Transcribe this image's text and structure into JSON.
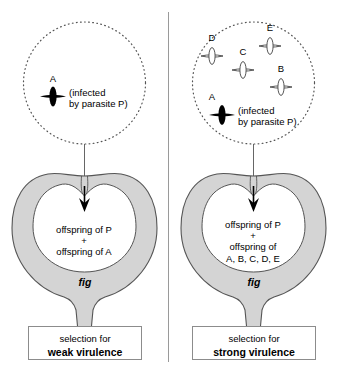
{
  "figure": {
    "colors": {
      "fig_flesh": "#d4d4d4",
      "fig_outline": "#555555",
      "circle_dotted": "#555555",
      "divider": "#9a9a9a",
      "caption_border": "#8c8c8c",
      "black": "#000000",
      "white": "#ffffff"
    }
  },
  "panels": [
    {
      "id": "weak-virulence",
      "circle": {
        "wasps": [
          {
            "id": "A",
            "label": "A",
            "style": "filled-black",
            "orientation": "vertical"
          }
        ],
        "note": "(infected\nby parasite P)"
      },
      "fig": {
        "cavity_text": "offspring of P\n+\noffspring of A",
        "label": "fig",
        "arrow": "down-arrow-into-fig"
      },
      "caption": {
        "line1": "selection for",
        "line2": "weak virulence"
      }
    },
    {
      "id": "strong-virulence",
      "circle": {
        "wasps": [
          {
            "id": "A",
            "label": "A",
            "style": "filled-black",
            "orientation": "vertical"
          },
          {
            "id": "B",
            "label": "B",
            "style": "outline",
            "orientation": "vertical"
          },
          {
            "id": "C",
            "label": "C",
            "style": "outline",
            "orientation": "vertical"
          },
          {
            "id": "D",
            "label": "D",
            "style": "outline",
            "orientation": "vertical"
          },
          {
            "id": "E",
            "label": "E",
            "style": "outline",
            "orientation": "vertical"
          }
        ],
        "note": "(infected\nby parasite P)"
      },
      "fig": {
        "cavity_text": "offspring of P\n+\noffspring of\nA, B, C, D, E",
        "label": "fig",
        "arrow": "down-arrow-into-fig"
      },
      "caption": {
        "line1": "selection for",
        "line2": "strong virulence"
      }
    }
  ]
}
